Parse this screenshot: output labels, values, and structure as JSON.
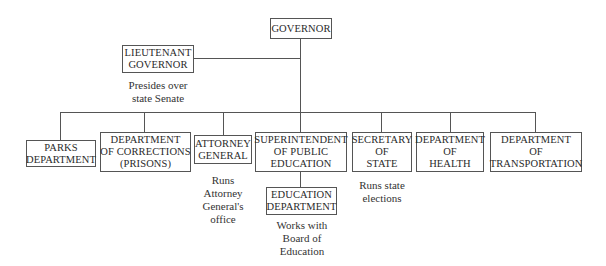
{
  "diagram": {
    "type": "org-chart",
    "root": {
      "label_lines": [
        "GOVERNOR"
      ]
    },
    "lieutenant": {
      "label_lines": [
        "LIEUTENANT",
        "GOVERNOR"
      ],
      "note_lines": [
        "Presides over",
        "state Senate"
      ]
    },
    "departments": [
      {
        "id": "parks",
        "label_lines": [
          "PARKS",
          "DEPARTMENT"
        ],
        "note_lines": []
      },
      {
        "id": "corrections",
        "label_lines": [
          "DEPARTMENT",
          "OF CORRECTIONS",
          "(PRISONS)"
        ],
        "note_lines": []
      },
      {
        "id": "attorney-general",
        "label_lines": [
          "ATTORNEY",
          "GENERAL"
        ],
        "note_lines": [
          "Runs",
          "Attorney",
          "General's",
          "office"
        ]
      },
      {
        "id": "superintendent",
        "label_lines": [
          "SUPERINTENDENT",
          "OF PUBLIC",
          "EDUCATION"
        ],
        "note_lines": []
      },
      {
        "id": "secretary-of-state",
        "label_lines": [
          "SECRETARY",
          "OF",
          "STATE"
        ],
        "note_lines": [
          "Runs state",
          "elections"
        ]
      },
      {
        "id": "health",
        "label_lines": [
          "DEPARTMENT",
          "OF",
          "HEALTH"
        ],
        "note_lines": []
      },
      {
        "id": "transportation",
        "label_lines": [
          "DEPARTMENT",
          "OF",
          "TRANSPORTATION"
        ],
        "note_lines": []
      }
    ],
    "sub_unit": {
      "parent": "superintendent",
      "label_lines": [
        "EDUCATION",
        "DEPARTMENT"
      ],
      "note_lines": [
        "Works with",
        "Board of",
        "Education"
      ]
    }
  }
}
